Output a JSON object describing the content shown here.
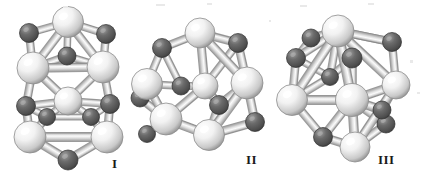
{
  "figure": {
    "type": "molecular-cluster-ball-and-stick",
    "background_color": "#ffffff",
    "panel_count": 3,
    "atom_types": [
      {
        "name": "large-light-atom",
        "color": "#f2f2f2",
        "shade_color": "#8f8f8f",
        "highlight_color": "#ffffff",
        "relative_radius": 1.0
      },
      {
        "name": "small-dark-atom",
        "color": "#6b6b6b",
        "shade_color": "#3a3a3a",
        "highlight_color": "#9a9a9a",
        "relative_radius": 0.62
      }
    ],
    "bond": {
      "name": "cylindrical-bond",
      "fill_color": "#e0e0e0",
      "highlight_color": "#fbfbfb",
      "edge_color": "#8a8a8a"
    }
  },
  "panels": [
    {
      "id": "panel-1",
      "label": "I",
      "label_x": 112,
      "label_y": 156,
      "description": "Prismatic cage isomer, elongated vertical arrangement",
      "atoms": [
        {
          "t": "L",
          "x": 68,
          "y": 22,
          "r": 15.5,
          "z": 6
        },
        {
          "t": "D",
          "x": 29,
          "y": 33,
          "r": 9.5,
          "z": 3
        },
        {
          "t": "D",
          "x": 106,
          "y": 34,
          "r": 9.5,
          "z": 3
        },
        {
          "t": "D",
          "x": 67,
          "y": 56,
          "r": 9.0,
          "z": 1
        },
        {
          "t": "L",
          "x": 33,
          "y": 68,
          "r": 16.0,
          "z": 7
        },
        {
          "t": "L",
          "x": 103,
          "y": 67,
          "r": 16.0,
          "z": 7
        },
        {
          "t": "L",
          "x": 68,
          "y": 101,
          "r": 14.0,
          "z": 5
        },
        {
          "t": "D",
          "x": 26,
          "y": 106,
          "r": 9.5,
          "z": 4
        },
        {
          "t": "D",
          "x": 110,
          "y": 104,
          "r": 9.5,
          "z": 4
        },
        {
          "t": "D",
          "x": 47,
          "y": 117,
          "r": 8.5,
          "z": 2
        },
        {
          "t": "D",
          "x": 91,
          "y": 117,
          "r": 8.5,
          "z": 2
        },
        {
          "t": "L",
          "x": 30,
          "y": 137,
          "r": 16.0,
          "z": 8
        },
        {
          "t": "L",
          "x": 107,
          "y": 137,
          "r": 16.0,
          "z": 8
        },
        {
          "t": "D",
          "x": 68,
          "y": 160,
          "r": 10.0,
          "z": 6
        }
      ],
      "bonds": [
        [
          0,
          1
        ],
        [
          0,
          2
        ],
        [
          0,
          3
        ],
        [
          0,
          4
        ],
        [
          0,
          5
        ],
        [
          1,
          4
        ],
        [
          2,
          5
        ],
        [
          3,
          4
        ],
        [
          3,
          5
        ],
        [
          4,
          5
        ],
        [
          4,
          6
        ],
        [
          5,
          6
        ],
        [
          4,
          7
        ],
        [
          5,
          8
        ],
        [
          6,
          9
        ],
        [
          6,
          10
        ],
        [
          6,
          7
        ],
        [
          6,
          8
        ],
        [
          7,
          9
        ],
        [
          8,
          10
        ],
        [
          7,
          11
        ],
        [
          8,
          12
        ],
        [
          9,
          11
        ],
        [
          10,
          12
        ],
        [
          11,
          12
        ],
        [
          11,
          13
        ],
        [
          12,
          13
        ],
        [
          9,
          10
        ]
      ]
    },
    {
      "id": "panel-2",
      "label": "II",
      "label_x": 246,
      "label_y": 152,
      "description": "Open cage isomer, roughly spherical network",
      "atoms": [
        {
          "t": "L",
          "x": 200,
          "y": 33,
          "r": 15.0,
          "z": 7
        },
        {
          "t": "D",
          "x": 162,
          "y": 48,
          "r": 9.5,
          "z": 4
        },
        {
          "t": "D",
          "x": 238,
          "y": 43,
          "r": 9.5,
          "z": 4
        },
        {
          "t": "L",
          "x": 147,
          "y": 84,
          "r": 15.5,
          "z": 5
        },
        {
          "t": "D",
          "x": 140,
          "y": 98,
          "r": 9.0,
          "z": 3
        },
        {
          "t": "D",
          "x": 181,
          "y": 86,
          "r": 9.0,
          "z": 3
        },
        {
          "t": "L",
          "x": 205,
          "y": 86,
          "r": 13.0,
          "z": 6
        },
        {
          "t": "L",
          "x": 247,
          "y": 83,
          "r": 16.0,
          "z": 8
        },
        {
          "t": "D",
          "x": 219,
          "y": 105,
          "r": 9.5,
          "z": 5
        },
        {
          "t": "L",
          "x": 166,
          "y": 119,
          "r": 16.0,
          "z": 7
        },
        {
          "t": "D",
          "x": 255,
          "y": 122,
          "r": 9.5,
          "z": 5
        },
        {
          "t": "L",
          "x": 209,
          "y": 135,
          "r": 15.5,
          "z": 9
        },
        {
          "t": "D",
          "x": 147,
          "y": 134,
          "r": 8.5,
          "z": 2
        }
      ],
      "bonds": [
        [
          0,
          1
        ],
        [
          0,
          2
        ],
        [
          0,
          6
        ],
        [
          0,
          7
        ],
        [
          1,
          3
        ],
        [
          2,
          7
        ],
        [
          3,
          4
        ],
        [
          3,
          5
        ],
        [
          3,
          9
        ],
        [
          5,
          6
        ],
        [
          6,
          8
        ],
        [
          6,
          9
        ],
        [
          7,
          8
        ],
        [
          7,
          10
        ],
        [
          8,
          11
        ],
        [
          9,
          11
        ],
        [
          9,
          12
        ],
        [
          10,
          11
        ],
        [
          4,
          9
        ],
        [
          2,
          6
        ],
        [
          1,
          5
        ],
        [
          11,
          7
        ]
      ]
    },
    {
      "id": "panel-3",
      "label": "III",
      "label_x": 378,
      "label_y": 152,
      "description": "Compact close-packed isomer, highest connectivity",
      "atoms": [
        {
          "t": "L",
          "x": 338,
          "y": 31,
          "r": 16.0,
          "z": 8
        },
        {
          "t": "D",
          "x": 311,
          "y": 38,
          "r": 9.0,
          "z": 3
        },
        {
          "t": "D",
          "x": 392,
          "y": 42,
          "r": 9.5,
          "z": 4
        },
        {
          "t": "D",
          "x": 296,
          "y": 58,
          "r": 9.5,
          "z": 4
        },
        {
          "t": "D",
          "x": 352,
          "y": 58,
          "r": 10.0,
          "z": 6
        },
        {
          "t": "L",
          "x": 396,
          "y": 85,
          "r": 14.0,
          "z": 6
        },
        {
          "t": "L",
          "x": 292,
          "y": 100,
          "r": 15.5,
          "z": 7
        },
        {
          "t": "L",
          "x": 352,
          "y": 100,
          "r": 16.5,
          "z": 9
        },
        {
          "t": "D",
          "x": 382,
          "y": 110,
          "r": 9.0,
          "z": 5
        },
        {
          "t": "D",
          "x": 386,
          "y": 124,
          "r": 9.0,
          "z": 4
        },
        {
          "t": "D",
          "x": 323,
          "y": 137,
          "r": 9.5,
          "z": 5
        },
        {
          "t": "L",
          "x": 355,
          "y": 147,
          "r": 15.0,
          "z": 7
        },
        {
          "t": "D",
          "x": 330,
          "y": 77,
          "r": 8.5,
          "z": 2
        }
      ],
      "bonds": [
        [
          0,
          1
        ],
        [
          0,
          2
        ],
        [
          0,
          3
        ],
        [
          0,
          4
        ],
        [
          0,
          5
        ],
        [
          0,
          6
        ],
        [
          0,
          7
        ],
        [
          0,
          12
        ],
        [
          1,
          3
        ],
        [
          2,
          5
        ],
        [
          3,
          6
        ],
        [
          4,
          7
        ],
        [
          4,
          12
        ],
        [
          5,
          7
        ],
        [
          5,
          8
        ],
        [
          6,
          7
        ],
        [
          6,
          10
        ],
        [
          6,
          12
        ],
        [
          7,
          8
        ],
        [
          7,
          9
        ],
        [
          7,
          10
        ],
        [
          7,
          11
        ],
        [
          8,
          9
        ],
        [
          9,
          11
        ],
        [
          10,
          11
        ],
        [
          2,
          0
        ],
        [
          3,
          12
        ],
        [
          11,
          5
        ]
      ]
    }
  ],
  "specks": [
    {
      "x": 156,
      "y": 4,
      "w": 9,
      "h": 2
    },
    {
      "x": 207,
      "y": 3,
      "w": 5,
      "h": 2
    },
    {
      "x": 300,
      "y": 5,
      "w": 7,
      "h": 2
    },
    {
      "x": 368,
      "y": 3,
      "w": 6,
      "h": 2
    },
    {
      "x": 63,
      "y": 6,
      "w": 5,
      "h": 2
    },
    {
      "x": 410,
      "y": 60,
      "w": 3,
      "h": 3
    },
    {
      "x": 417,
      "y": 92,
      "w": 3,
      "h": 2
    },
    {
      "x": 269,
      "y": 20,
      "w": 2,
      "h": 2
    }
  ]
}
